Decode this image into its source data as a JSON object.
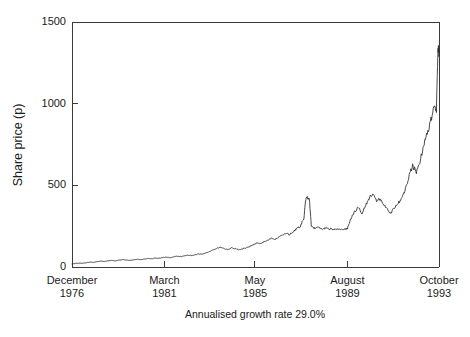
{
  "chart_data": {
    "type": "line",
    "title": "",
    "subtitle": "",
    "xlabel": "",
    "ylabel": "Share price (p)",
    "caption": "Annualised growth rate 29.0%",
    "grid": false,
    "legend": "none",
    "line_color": "#2b2b2b",
    "background_color": "#ffffff",
    "axis_color": "#3a3a3a",
    "ylim": [
      0,
      1500
    ],
    "yticks": [
      0,
      500,
      1000,
      1500
    ],
    "ytick_labels": [
      "0",
      "500",
      "1000",
      "1500"
    ],
    "xlim": [
      1976.92,
      1993.79
    ],
    "xticks": [
      1976.92,
      1981.17,
      1985.33,
      1989.58,
      1993.79
    ],
    "xtick_labels": [
      {
        "month": "December",
        "year": "1976"
      },
      {
        "month": "March",
        "year": "1981"
      },
      {
        "month": "May",
        "year": "1985"
      },
      {
        "month": "August",
        "year": "1989"
      },
      {
        "month": "October",
        "year": "1993"
      }
    ],
    "series": [
      {
        "name": "Share price",
        "units": "p",
        "x": [
          1976.92,
          1977.08,
          1977.25,
          1977.42,
          1977.58,
          1977.75,
          1977.92,
          1978.08,
          1978.25,
          1978.42,
          1978.58,
          1978.75,
          1978.92,
          1979.08,
          1979.25,
          1979.42,
          1979.58,
          1979.75,
          1979.92,
          1980.08,
          1980.25,
          1980.42,
          1980.58,
          1980.75,
          1980.92,
          1981.08,
          1981.25,
          1981.42,
          1981.58,
          1981.75,
          1981.92,
          1982.08,
          1982.25,
          1982.42,
          1982.58,
          1982.75,
          1982.92,
          1983.08,
          1983.25,
          1983.42,
          1983.58,
          1983.75,
          1983.92,
          1984.08,
          1984.25,
          1984.42,
          1984.58,
          1984.75,
          1984.92,
          1985.08,
          1985.25,
          1985.42,
          1985.58,
          1985.75,
          1985.92,
          1986.08,
          1986.25,
          1986.42,
          1986.58,
          1986.75,
          1986.92,
          1987.08,
          1987.25,
          1987.42,
          1987.58,
          1987.67,
          1987.75,
          1987.83,
          1987.92,
          1988.08,
          1988.25,
          1988.42,
          1988.58,
          1988.75,
          1988.92,
          1989.08,
          1989.25,
          1989.42,
          1989.58,
          1989.75,
          1989.92,
          1990.08,
          1990.25,
          1990.42,
          1990.58,
          1990.75,
          1990.92,
          1991.08,
          1991.25,
          1991.42,
          1991.58,
          1991.75,
          1991.92,
          1992.08,
          1992.25,
          1992.42,
          1992.58,
          1992.75,
          1992.92,
          1993.08,
          1993.25,
          1993.42,
          1993.58,
          1993.67,
          1993.75,
          1993.79
        ],
        "values": [
          20,
          22,
          24,
          23,
          26,
          30,
          28,
          33,
          36,
          34,
          38,
          40,
          37,
          42,
          45,
          43,
          40,
          44,
          47,
          45,
          48,
          52,
          50,
          55,
          53,
          58,
          60,
          57,
          62,
          66,
          63,
          68,
          72,
          70,
          75,
          80,
          78,
          85,
          95,
          105,
          115,
          120,
          112,
          108,
          118,
          112,
          105,
          110,
          118,
          125,
          135,
          148,
          142,
          155,
          165,
          175,
          168,
          185,
          195,
          205,
          198,
          215,
          235,
          250,
          300,
          420,
          425,
          415,
          250,
          235,
          245,
          230,
          240,
          235,
          230,
          230,
          232,
          230,
          235,
          300,
          340,
          365,
          330,
          380,
          420,
          450,
          400,
          420,
          380,
          350,
          330,
          365,
          390,
          420,
          480,
          560,
          620,
          580,
          650,
          740,
          820,
          900,
          1000,
          960,
          1340,
          1300
        ]
      }
    ]
  },
  "axes": {
    "plot_left_px": 72,
    "plot_right_px": 439,
    "plot_top_px": 22,
    "plot_bottom_px": 267
  }
}
